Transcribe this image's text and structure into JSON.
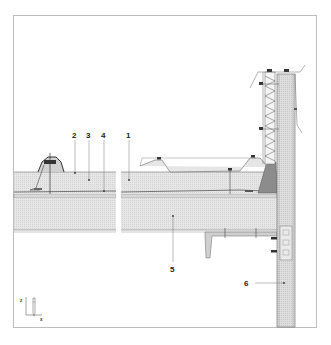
{
  "diagram": {
    "type": "construction-section-detail",
    "colors": {
      "frame": "#bdbdbd",
      "line": "#555555",
      "insulation_fill": "#e4e4e4",
      "slab_fill": "#ececec",
      "wall_fill": "#dcdcdc",
      "wedge_fill": "#8c8c8c",
      "leader": "#666666"
    },
    "labels": [
      {
        "id": "1",
        "text": "1"
      },
      {
        "id": "2",
        "text": "2"
      },
      {
        "id": "3",
        "text": "3"
      },
      {
        "id": "4",
        "text": "4"
      },
      {
        "id": "5",
        "text": "5"
      },
      {
        "id": "6",
        "text": "6"
      }
    ],
    "axes": {
      "z_label": "z",
      "x_label": "x"
    }
  }
}
